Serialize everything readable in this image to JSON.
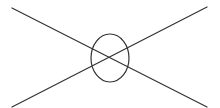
{
  "diagram": {
    "width": 220,
    "height": 108,
    "background": "#ffffff",
    "stroke_color": "#333333",
    "stroke_width": 1.2,
    "shapes": {
      "line_a": {
        "x1": 12,
        "y1": 8,
        "x2": 207,
        "y2": 107
      },
      "line_b": {
        "x1": 207,
        "y1": 7,
        "x2": 12,
        "y2": 107
      },
      "center_ellipse": {
        "cx": 110,
        "cy": 58,
        "rx": 19,
        "ry": 24
      }
    }
  }
}
